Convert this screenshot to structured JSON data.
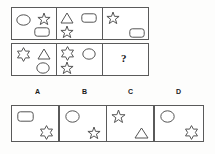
{
  "puzzle": {
    "type": "visual-analogy-matrix",
    "question_mark": "?",
    "matrix": {
      "rows": [
        {
          "index": 1,
          "cells": [
            {
              "position": 1,
              "shapes": [
                {
                  "name": "circle",
                  "x": 4,
                  "y": 6,
                  "w": 15,
                  "h": 12
                },
                {
                  "name": "five-point-star",
                  "x": 25,
                  "y": 4,
                  "w": 14,
                  "h": 14
                },
                {
                  "name": "rounded-rectangle",
                  "x": 22,
                  "y": 19,
                  "w": 16,
                  "h": 10
                }
              ]
            },
            {
              "position": 2,
              "shapes": [
                {
                  "name": "triangle",
                  "x": 3,
                  "y": 4,
                  "w": 14,
                  "h": 12
                },
                {
                  "name": "rounded-rectangle",
                  "x": 24,
                  "y": 5,
                  "w": 16,
                  "h": 10
                },
                {
                  "name": "five-point-star",
                  "x": 3,
                  "y": 17,
                  "w": 14,
                  "h": 14
                }
              ]
            },
            {
              "position": 3,
              "shapes": [
                {
                  "name": "five-point-star",
                  "x": 3,
                  "y": 3,
                  "w": 14,
                  "h": 14
                },
                {
                  "name": "rounded-rectangle",
                  "x": 26,
                  "y": 20,
                  "w": 16,
                  "h": 10
                }
              ]
            }
          ]
        },
        {
          "index": 2,
          "cells": [
            {
              "position": 1,
              "shapes": [
                {
                  "name": "six-point-star",
                  "x": 4,
                  "y": 3,
                  "w": 15,
                  "h": 15
                },
                {
                  "name": "triangle",
                  "x": 25,
                  "y": 4,
                  "w": 14,
                  "h": 12
                },
                {
                  "name": "circle",
                  "x": 24,
                  "y": 18,
                  "w": 14,
                  "h": 12
                }
              ]
            },
            {
              "position": 2,
              "shapes": [
                {
                  "name": "six-point-star",
                  "x": 3,
                  "y": 2,
                  "w": 15,
                  "h": 15
                },
                {
                  "name": "circle",
                  "x": 25,
                  "y": 4,
                  "w": 14,
                  "h": 12
                },
                {
                  "name": "five-point-star",
                  "x": 3,
                  "y": 17,
                  "w": 14,
                  "h": 14
                }
              ]
            },
            {
              "position": 3,
              "is_answer_slot": true,
              "shapes": []
            }
          ]
        }
      ]
    },
    "option_labels": [
      "A",
      "B",
      "C",
      "D"
    ],
    "options": [
      {
        "label": "A",
        "shapes": [
          {
            "name": "rounded-rectangle",
            "x": 5,
            "y": 5,
            "w": 17,
            "h": 11
          },
          {
            "name": "six-point-star",
            "x": 27,
            "y": 19,
            "w": 15,
            "h": 15
          }
        ]
      },
      {
        "label": "B",
        "shapes": [
          {
            "name": "circle",
            "x": 5,
            "y": 4,
            "w": 15,
            "h": 13
          },
          {
            "name": "five-point-star",
            "x": 27,
            "y": 20,
            "w": 14,
            "h": 14
          }
        ]
      },
      {
        "label": "C",
        "shapes": [
          {
            "name": "five-point-star",
            "x": 4,
            "y": 3,
            "w": 15,
            "h": 15
          },
          {
            "name": "triangle",
            "x": 27,
            "y": 21,
            "w": 15,
            "h": 12
          }
        ]
      },
      {
        "label": "D",
        "shapes": [
          {
            "name": "circle",
            "x": 5,
            "y": 4,
            "w": 15,
            "h": 13
          },
          {
            "name": "six-point-star",
            "x": 29,
            "y": 19,
            "w": 15,
            "h": 15
          }
        ]
      }
    ],
    "colors": {
      "background": "#fdfdfc",
      "border": "#5a5a5a",
      "shape_stroke": "#555555",
      "text": "#1a1a1a"
    }
  }
}
